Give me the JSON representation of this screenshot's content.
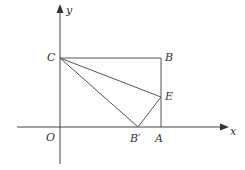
{
  "diagram": {
    "type": "coordinate-geometry",
    "axes": {
      "x_label": "x",
      "y_label": "y",
      "origin_label": "O"
    },
    "points": {
      "C": {
        "label": "C"
      },
      "B": {
        "label": "B"
      },
      "E": {
        "label": "E"
      },
      "B_prime": {
        "label": "B′"
      },
      "A": {
        "label": "A"
      },
      "O": {
        "label": "O"
      }
    },
    "segments": [
      "CB",
      "BA",
      "CE",
      "CB′",
      "B′E",
      "EA"
    ],
    "colors": {
      "axis": "#444444",
      "line": "#555555",
      "label": "#333333",
      "background": "#ffffff"
    }
  }
}
